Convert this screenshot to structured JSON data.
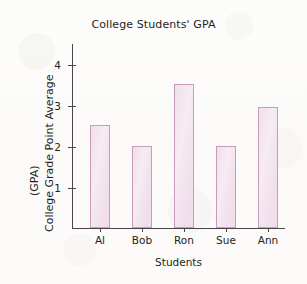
{
  "chart_data": {
    "type": "bar",
    "title": "College Students' GPA",
    "xlabel": "Students",
    "ylabel": "College Grade Point Average",
    "ylabel_line2": "(GPA)",
    "categories": [
      "Al",
      "Bob",
      "Ron",
      "Sue",
      "Ann"
    ],
    "values": [
      2.5,
      2.0,
      3.5,
      2.0,
      2.95
    ],
    "ylim": [
      0,
      4.5
    ],
    "yticks": [
      1,
      2,
      3,
      4
    ],
    "ytick_labels": [
      "1",
      "2",
      "3",
      "4"
    ],
    "grid": false,
    "legend": false,
    "bar_fill_color": "#f3e6ef",
    "bar_edge_color": "#c79cb8",
    "axis_color": "#4a4648",
    "text_color": "#231f20",
    "background_color": "#fdfcfb"
  }
}
